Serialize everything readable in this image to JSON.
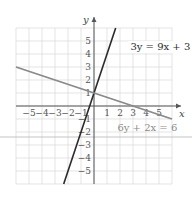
{
  "chart_data": {
    "type": "line",
    "title": "",
    "xlabel": "x",
    "ylabel": "y",
    "xlim": [
      -6,
      6
    ],
    "ylim": [
      -6,
      6
    ],
    "grid": true,
    "x_ticks": [
      -5,
      -4,
      -3,
      -2,
      -1,
      1,
      2,
      3,
      4,
      5
    ],
    "y_ticks": [
      -5,
      -4,
      -3,
      -2,
      -1,
      1,
      2,
      3,
      4,
      5
    ],
    "x_tick_labels": [
      "−5",
      "−4",
      "−3",
      "−2",
      "−1",
      "1",
      "2",
      "3",
      "4",
      "5"
    ],
    "y_tick_labels": [
      "−5",
      "−4",
      "−3",
      "−2",
      "−1",
      "1",
      "2",
      "3",
      "4",
      "5"
    ],
    "series": [
      {
        "name": "3y = 9x + 3",
        "equation": "3y = 9x + 3",
        "slope": 3,
        "intercept": 1,
        "color": "#2b2b2b",
        "x": [
          -2.333,
          1.667
        ],
        "y": [
          -6,
          6
        ],
        "label_position": {
          "x": 2.8,
          "y": 4.3
        }
      },
      {
        "name": "6y + 2x = 6",
        "equation": "6y + 2x = 6",
        "slope": -0.3333,
        "intercept": 1,
        "color": "#8a8a8a",
        "x": [
          -6,
          6
        ],
        "y": [
          3,
          -1
        ],
        "label_position": {
          "x": 1.8,
          "y": -1.9
        }
      }
    ],
    "intersection": {
      "x": 0,
      "y": 1
    }
  },
  "colors": {
    "grid": "#d9d9d9",
    "axis": "#555555",
    "divider": "#b5b5b5"
  }
}
